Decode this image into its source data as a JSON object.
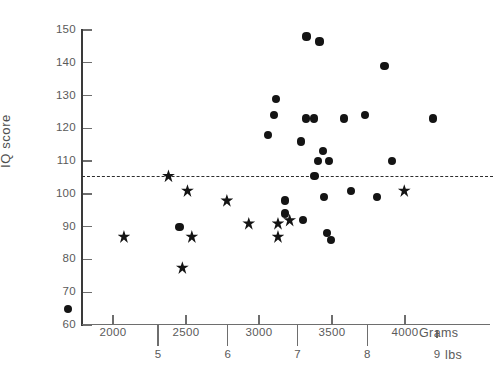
{
  "chart_data": {
    "type": "scatter",
    "title": "",
    "xlabel": "Grams",
    "ylabel": "IQ score",
    "xlabel_secondary": "lbs",
    "xlim": [
      1630,
      4440
    ],
    "ylim": [
      60,
      150
    ],
    "grid": false,
    "legend": false,
    "y_ticks": [
      150,
      140,
      130,
      120,
      110,
      100,
      90,
      80,
      70,
      60
    ],
    "y_tick_labels": [
      "150",
      "140",
      "130",
      "120",
      "110",
      "100",
      "90",
      "80",
      "70",
      "60"
    ],
    "x_ticks": [
      2000,
      2500,
      3000,
      3500,
      4000
    ],
    "x_tick_labels": [
      "2000",
      "2500",
      "3000",
      "3500",
      "4000"
    ],
    "x_ticks_secondary_lbs": [
      5,
      6,
      7,
      8,
      9
    ],
    "x_tick_labels_secondary": [
      "5",
      "6",
      "7",
      "8",
      "9"
    ],
    "reference_line": {
      "orientation": "horizontal",
      "value": 105.5,
      "style": "dashed",
      "color": "#2e2e2e",
      "label": ""
    },
    "series": [
      {
        "name": "circle-group",
        "marker": "circle",
        "color": "#141414",
        "points": [
          {
            "x": 1690,
            "y": 65
          },
          {
            "x": 2455,
            "y": 90
          },
          {
            "x": 3060,
            "y": 118
          },
          {
            "x": 3115,
            "y": 129
          },
          {
            "x": 3100,
            "y": 124
          },
          {
            "x": 3325,
            "y": 148
          },
          {
            "x": 3415,
            "y": 146.5
          },
          {
            "x": 3320,
            "y": 123
          },
          {
            "x": 3375,
            "y": 123
          },
          {
            "x": 3580,
            "y": 123
          },
          {
            "x": 3725,
            "y": 124
          },
          {
            "x": 3860,
            "y": 139
          },
          {
            "x": 4190,
            "y": 123
          },
          {
            "x": 3440,
            "y": 113
          },
          {
            "x": 3405,
            "y": 110
          },
          {
            "x": 3480,
            "y": 110
          },
          {
            "x": 3380,
            "y": 105.5
          },
          {
            "x": 3290,
            "y": 116
          },
          {
            "x": 3630,
            "y": 101
          },
          {
            "x": 3445,
            "y": 99
          },
          {
            "x": 3910,
            "y": 110
          },
          {
            "x": 3810,
            "y": 99
          },
          {
            "x": 3180,
            "y": 98
          },
          {
            "x": 3180,
            "y": 94
          },
          {
            "x": 3300,
            "y": 92
          },
          {
            "x": 3465,
            "y": 88
          },
          {
            "x": 3495,
            "y": 86
          }
        ]
      },
      {
        "name": "star-group",
        "marker": "star",
        "color": "#141414",
        "points": [
          {
            "x": 2075,
            "y": 87
          },
          {
            "x": 2380,
            "y": 105.5
          },
          {
            "x": 2510,
            "y": 101
          },
          {
            "x": 2540,
            "y": 87
          },
          {
            "x": 2475,
            "y": 77.5
          },
          {
            "x": 2780,
            "y": 98
          },
          {
            "x": 2930,
            "y": 91
          },
          {
            "x": 3210,
            "y": 92
          },
          {
            "x": 3130,
            "y": 91
          },
          {
            "x": 3130,
            "y": 87
          },
          {
            "x": 3995,
            "y": 101
          }
        ]
      }
    ]
  },
  "axis_titles": {
    "y": "IQ score",
    "x_unit": "Grams",
    "x_unit_secondary": "lbs"
  }
}
